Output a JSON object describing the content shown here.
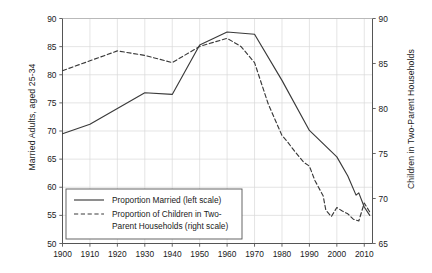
{
  "chart_data": {
    "type": "line",
    "title": "",
    "xlabel": "",
    "ylabel": "Married Adults, aged 25-34",
    "ylabel_right": "Children in Two-Parent Households",
    "xlim": [
      1900,
      2013
    ],
    "ylim": [
      50,
      90
    ],
    "ylim_right": [
      65,
      90
    ],
    "grid": true,
    "legend_position": "lower left",
    "xticks": [
      1900,
      1910,
      1920,
      1930,
      1940,
      1950,
      1960,
      1970,
      1980,
      1990,
      2000,
      2010
    ],
    "xtick_labels": [
      "1900",
      "1910",
      "1920",
      "1930",
      "1940",
      "1950",
      "1960",
      "1970",
      "1980",
      "1990",
      "2000",
      "2010"
    ],
    "yticks": [
      50,
      55,
      60,
      65,
      70,
      75,
      80,
      85,
      90
    ],
    "ytick_labels": [
      "50",
      "55",
      "60",
      "65",
      "70",
      "75",
      "80",
      "85",
      "90"
    ],
    "yticks_right": [
      65,
      70,
      75,
      80,
      85,
      90
    ],
    "ytick_labels_right": [
      "65",
      "70",
      "75",
      "80",
      "85",
      "90"
    ],
    "series": [
      {
        "name": "Proportion Married (left scale)",
        "axis": "left",
        "style": "solid",
        "color": "#3a3a3a",
        "x": [
          1900,
          1910,
          1920,
          1930,
          1940,
          1950,
          1960,
          1970,
          1980,
          1990,
          2000,
          2004,
          2007,
          2008,
          2010,
          2012
        ],
        "values": [
          69.5,
          71.2,
          74.0,
          76.8,
          76.5,
          85.3,
          87.6,
          87.2,
          79.0,
          70.1,
          65.4,
          62.0,
          58.6,
          59.0,
          56.5,
          55.0
        ]
      },
      {
        "name": "Proportion of Children in Two-Parent Households (right scale)",
        "axis": "right",
        "style": "dashed",
        "color": "#3a3a3a",
        "x": [
          1900,
          1910,
          1920,
          1930,
          1940,
          1950,
          1960,
          1965,
          1970,
          1975,
          1980,
          1982,
          1985,
          1988,
          1990,
          1992,
          1995,
          1996,
          1998,
          2000,
          2002,
          2004,
          2006,
          2008,
          2010,
          2012
        ],
        "values": [
          84.2,
          85.3,
          86.4,
          85.9,
          85.1,
          86.9,
          87.8,
          86.9,
          85.1,
          80.5,
          77.0,
          76.3,
          75.1,
          74.0,
          73.6,
          72.0,
          70.3,
          68.7,
          68.0,
          69.0,
          68.6,
          68.3,
          67.7,
          67.5,
          69.5,
          68.5
        ]
      }
    ],
    "legend": [
      {
        "label": "Proportion Married (left scale)",
        "style": "solid"
      },
      {
        "label": "Proportion of Children in Two-",
        "label2": "Parent Households (right scale)",
        "style": "dashed"
      }
    ],
    "colors": {
      "line": "#3a3a3a",
      "grid": "#d9d9d9",
      "axis": "#555555",
      "text": "#1a1a1a",
      "background": "#ffffff"
    }
  }
}
